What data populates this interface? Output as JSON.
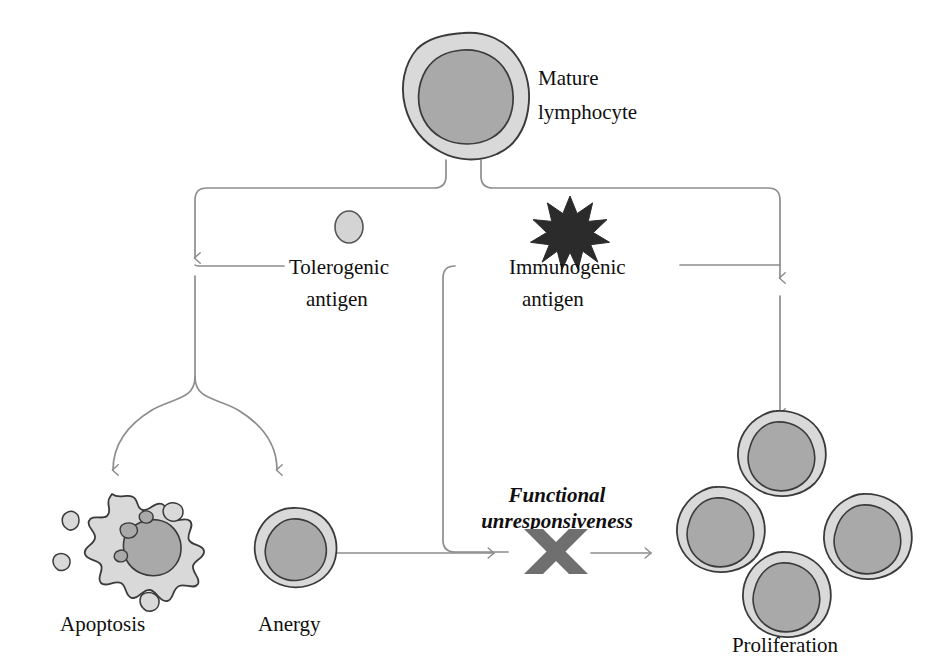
{
  "figure": {
    "domain": "biology-diagram",
    "title_visible": false,
    "background_color": "#ffffff",
    "canvas": {
      "width": 945,
      "height": 666
    }
  },
  "palette": {
    "cytoplasm_fill": "#d9d9d9",
    "nucleus_fill": "#a9a9a9",
    "cell_outline": "#3a3a3a",
    "connector_stroke": "#8d8d8d",
    "antigen_star_fill": "#2b2b2b",
    "tolerogenic_antigen_fill": "#d4d4d4",
    "block_x_fill": "#6f6f6f",
    "text_color": "#100f0f"
  },
  "labels": {
    "mature_lymphocyte_line1": "Mature",
    "mature_lymphocyte_line2": "lymphocyte",
    "tolerogenic_line1": "Tolerogenic",
    "tolerogenic_line2": "antigen",
    "immunogenic_line1": "Immunogenic",
    "immunogenic_line2": "antigen",
    "functional_line1": "Functional",
    "functional_line2": "unresponsiveness",
    "apoptosis": "Apoptosis",
    "anergy": "Anergy",
    "proliferation": "Proliferation"
  },
  "icons": {
    "mature_lymphocyte": "lymphocyte-cell-icon",
    "tolerogenic_antigen": "small-circle-antigen-icon",
    "immunogenic_antigen": "starburst-antigen-icon",
    "apoptotic_cell": "apoptotic-blebbing-cell-icon",
    "anergic_cell": "lymphocyte-cell-icon",
    "proliferating_cells": "lymphocyte-cell-icon",
    "block_marker": "x-block-icon"
  },
  "nodes": [
    {
      "id": "mature-lymphocyte",
      "label": "Mature lymphocyte",
      "cx": 463,
      "cy": 92,
      "kind": "cell"
    },
    {
      "id": "tolerogenic-antigen",
      "label": "Tolerogenic antigen",
      "cx": 349,
      "cy": 227,
      "kind": "antigen"
    },
    {
      "id": "immunogenic-antigen",
      "label": "Immunogenic antigen",
      "cx": 570,
      "cy": 226,
      "kind": "antigen"
    },
    {
      "id": "apoptosis",
      "label": "Apoptosis",
      "cx": 113,
      "cy": 548,
      "kind": "cell-outcome"
    },
    {
      "id": "anergy",
      "label": "Anergy",
      "cx": 292,
      "cy": 551,
      "kind": "cell-outcome"
    },
    {
      "id": "functional-unresponsiveness",
      "label": "Functional unresponsiveness",
      "cx": 557,
      "cy": 512,
      "kind": "annotation"
    },
    {
      "id": "proliferation",
      "label": "Proliferation",
      "cx": 800,
      "cy": 520,
      "kind": "cell-outcome"
    }
  ],
  "proliferation_cells": [
    {
      "cx": 776,
      "cy": 444
    },
    {
      "cx": 715,
      "cy": 520
    },
    {
      "cx": 862,
      "cy": 527
    },
    {
      "cx": 781,
      "cy": 585
    }
  ],
  "edges": [
    {
      "from": "mature-lymphocyte",
      "to": "tolerogenic-branch",
      "arrow": true
    },
    {
      "from": "mature-lymphocyte",
      "to": "immunogenic-branch",
      "arrow": true
    },
    {
      "from": "tolerogenic-branch",
      "to": "apoptosis",
      "arrow": true
    },
    {
      "from": "tolerogenic-branch",
      "to": "anergy",
      "arrow": true
    },
    {
      "from": "immunogenic-branch",
      "to": "proliferation",
      "arrow": true
    },
    {
      "from": "anergy",
      "to": "block-x",
      "arrow": true
    },
    {
      "from": "immunogenic-antigen",
      "to": "block-x",
      "arrow": true
    },
    {
      "from": "block-x",
      "to": "proliferation",
      "arrow": true
    }
  ]
}
